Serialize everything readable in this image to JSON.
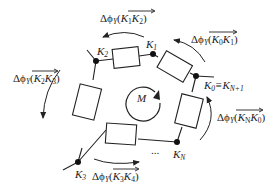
{
  "diagram": {
    "title": "",
    "center_label": "M",
    "nodes": [
      {
        "id": "K2",
        "label": "K",
        "sub": "2",
        "x": 96,
        "y": 61
      },
      {
        "id": "K1",
        "label": "K",
        "sub": "1",
        "x": 153,
        "y": 54
      },
      {
        "id": "K0",
        "label": "K",
        "sub": "0",
        "suffix": "≡K",
        "suffix_sub": "N+1",
        "x": 196,
        "y": 76
      },
      {
        "id": "KN",
        "label": "K",
        "sub": "N",
        "x": 177,
        "y": 142
      },
      {
        "id": "K3",
        "label": "K",
        "sub": "3",
        "x": 78,
        "y": 162
      }
    ],
    "edges": [
      {
        "from": "K2",
        "to": "K1",
        "element": "resistor"
      },
      {
        "from": "K1",
        "to": "K0",
        "element": "resistor"
      },
      {
        "from": "K0",
        "to": "KN",
        "element": "resistor"
      },
      {
        "from": "KN",
        "to": "K3",
        "element": "resistor",
        "ellipsis": "..."
      },
      {
        "from": "K3",
        "to": "K2",
        "element": "resistor"
      }
    ],
    "flux_labels": [
      {
        "id": "K1K2",
        "prefix": "Δϕ",
        "prefix_sub": "Y",
        "a": "K",
        "a_sub": "1",
        "b": "K",
        "b_sub": "2"
      },
      {
        "id": "K0K1",
        "prefix": "Δϕ",
        "prefix_sub": "Y",
        "a": "K",
        "a_sub": "0",
        "b": "K",
        "b_sub": "1"
      },
      {
        "id": "K2K3",
        "prefix": "Δϕ",
        "prefix_sub": "Y",
        "a": "K",
        "a_sub": "2",
        "b": "K",
        "b_sub": "3"
      },
      {
        "id": "KNK0",
        "prefix": "Δϕ",
        "prefix_sub": "Y",
        "a": "K",
        "a_sub": "N",
        "b": "K",
        "b_sub": "0"
      },
      {
        "id": "K3K4",
        "prefix": "Δϕ",
        "prefix_sub": "Y",
        "a": "K",
        "a_sub": "3",
        "b": "K",
        "b_sub": "4"
      }
    ],
    "ellipsis": "...",
    "colors": {
      "line": "#222222",
      "background": "#ffffff"
    }
  }
}
